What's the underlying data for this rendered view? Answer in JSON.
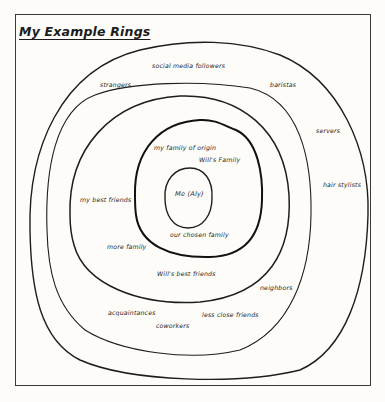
{
  "diagram": {
    "title": "My Example Rings",
    "type": "concentric-rings",
    "rings": [
      {
        "level": 1,
        "name": "center",
        "labels": [
          "Me (Aly)"
        ]
      },
      {
        "level": 2,
        "name": "inner-ring",
        "labels": [
          "my family of origin",
          "Will's Family",
          "our chosen family"
        ]
      },
      {
        "level": 3,
        "name": "close-ring",
        "labels": [
          "my best friends",
          "more family",
          "Will's best friends"
        ]
      },
      {
        "level": 4,
        "name": "middle-ring",
        "labels": [
          "neighbors",
          "acquaintances",
          "coworkers",
          "less close friends"
        ]
      },
      {
        "level": 5,
        "name": "outer-ring",
        "labels": [
          "social media followers",
          "strangers",
          "baristas",
          "servers",
          "hair stylists"
        ]
      }
    ]
  },
  "labels": {
    "me": "Me (Aly)",
    "family_of_origin": "my family of origin",
    "wills_family": "Will's Family",
    "chosen_family": "our chosen family",
    "best_friends": "my best friends",
    "more_family": "more family",
    "wills_best_friends": "Will's best friends",
    "neighbors": "neighbors",
    "acquaintances": "acquaintances",
    "coworkers": "coworkers",
    "less_close_friends": "less close friends",
    "social_media_followers": "social media followers",
    "strangers": "strangers",
    "baristas": "baristas",
    "servers": "servers",
    "hair_stylists": "hair stylists"
  },
  "colors": {
    "background": "#fdfcf8",
    "ink": "#1e1e1e",
    "frame": "#3a3a3a"
  }
}
